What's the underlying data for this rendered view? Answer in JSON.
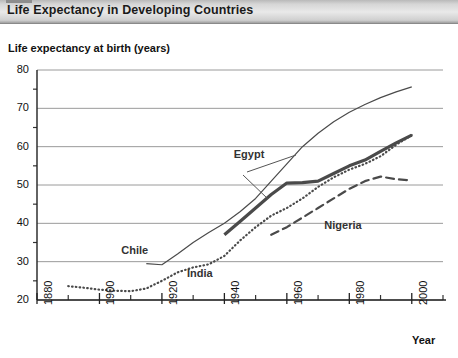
{
  "window": {
    "title": "Life Expectancy in Developing Countries"
  },
  "chart_data": {
    "type": "line",
    "title": "Life Expectancy in Developing Countries",
    "ylabel": "Life expectancy at birth (years)",
    "xlabel": "Year",
    "xlim": [
      1880,
      2010
    ],
    "ylim": [
      20,
      80
    ],
    "xticks": [
      1880,
      1900,
      1920,
      1940,
      1960,
      1980,
      2000
    ],
    "xtick_labels": [
      "1880",
      "1900",
      "1920",
      "1940",
      "1960",
      "1980",
      "2000"
    ],
    "xminor_ticks": [
      1890,
      1910,
      1930,
      1950,
      1970,
      1990,
      2010
    ],
    "yticks": [
      20,
      30,
      40,
      50,
      60,
      70,
      80
    ],
    "ytick_labels": [
      "20",
      "30",
      "40",
      "50",
      "60",
      "70",
      "80"
    ],
    "yminor_ticks": [
      25,
      35,
      45,
      55,
      65,
      75
    ],
    "grid": "horizontal",
    "legend": "inline-labels",
    "series": [
      {
        "name": "Chile",
        "style": "thin-solid",
        "color": "#4a4a4a",
        "label_x": 1907,
        "label_y": 32.5,
        "points": [
          [
            1915,
            29.5
          ],
          [
            1920,
            29.2
          ],
          [
            1925,
            32.0
          ],
          [
            1930,
            35.0
          ],
          [
            1935,
            37.6
          ],
          [
            1940,
            40.0
          ],
          [
            1945,
            43.0
          ],
          [
            1950,
            46.5
          ],
          [
            1955,
            51.0
          ],
          [
            1960,
            55.5
          ],
          [
            1965,
            60.0
          ],
          [
            1970,
            63.5
          ],
          [
            1975,
            66.5
          ],
          [
            1980,
            69.0
          ],
          [
            1985,
            71.0
          ],
          [
            1990,
            72.8
          ],
          [
            1995,
            74.3
          ],
          [
            2000,
            75.6
          ]
        ]
      },
      {
        "name": "Egypt",
        "style": "thick-solid",
        "color": "#4a4a4a",
        "label_x": 1943,
        "label_y": 57.5,
        "points": [
          [
            1940,
            37.0
          ],
          [
            1945,
            40.5
          ],
          [
            1950,
            44.0
          ],
          [
            1955,
            47.5
          ],
          [
            1960,
            50.5
          ],
          [
            1965,
            50.6
          ],
          [
            1970,
            51.0
          ],
          [
            1975,
            53.0
          ],
          [
            1980,
            55.0
          ],
          [
            1985,
            56.5
          ],
          [
            1990,
            58.8
          ],
          [
            1995,
            61.0
          ],
          [
            2000,
            63.0
          ]
        ]
      },
      {
        "name": "India",
        "style": "dotted",
        "color": "#4a4a4a",
        "label_x": 1928,
        "label_y": 26.5,
        "points": [
          [
            1890,
            23.6
          ],
          [
            1895,
            23.2
          ],
          [
            1900,
            22.7
          ],
          [
            1905,
            22.4
          ],
          [
            1910,
            22.3
          ],
          [
            1915,
            23.0
          ],
          [
            1920,
            25.0
          ],
          [
            1925,
            27.2
          ],
          [
            1930,
            28.5
          ],
          [
            1935,
            29.3
          ],
          [
            1940,
            31.5
          ],
          [
            1945,
            35.5
          ],
          [
            1950,
            39.0
          ],
          [
            1955,
            42.0
          ],
          [
            1960,
            44.0
          ],
          [
            1965,
            46.5
          ],
          [
            1970,
            49.5
          ],
          [
            1975,
            52.0
          ],
          [
            1980,
            54.0
          ],
          [
            1985,
            55.5
          ],
          [
            1990,
            57.5
          ],
          [
            1995,
            60.5
          ],
          [
            2000,
            63.0
          ]
        ]
      },
      {
        "name": "Nigeria",
        "style": "dashed",
        "color": "#4a4a4a",
        "label_x": 1972,
        "label_y": 39.0,
        "points": [
          [
            1955,
            37.0
          ],
          [
            1960,
            39.0
          ],
          [
            1965,
            41.5
          ],
          [
            1970,
            44.0
          ],
          [
            1975,
            46.5
          ],
          [
            1980,
            49.0
          ],
          [
            1985,
            51.0
          ],
          [
            1990,
            52.2
          ],
          [
            1995,
            51.5
          ],
          [
            2000,
            51.2
          ]
        ]
      }
    ]
  }
}
